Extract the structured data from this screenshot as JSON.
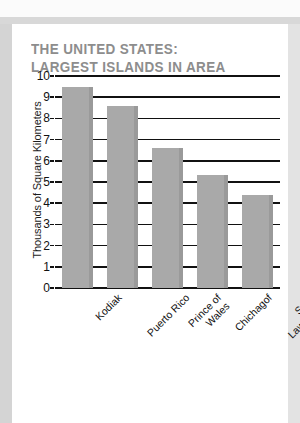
{
  "title": {
    "text": "THE UNITED STATES:\nLARGEST ISLANDS IN AREA",
    "color": "#8d8d8d"
  },
  "chart_data": {
    "type": "bar",
    "title": "THE UNITED STATES: LARGEST ISLANDS IN AREA",
    "xlabel": "",
    "ylabel": "Thousands of Square Kilometers",
    "categories": [
      "Kodiak",
      "Puerto Rico",
      "Prince of\nWales",
      "Chichagof",
      "Saint\nLawrence"
    ],
    "values": [
      9.5,
      8.6,
      6.6,
      5.35,
      4.4
    ],
    "ylim": [
      0,
      10
    ],
    "yticks": [
      "0",
      "1",
      "2",
      "3",
      "4",
      "5",
      "6",
      "7",
      "8",
      "9",
      "10"
    ],
    "grid": true,
    "legend": "none",
    "bar_color": "#a9a9a9",
    "bar_edge_color": "#9a9a9a",
    "gridline_color": "#111111"
  }
}
